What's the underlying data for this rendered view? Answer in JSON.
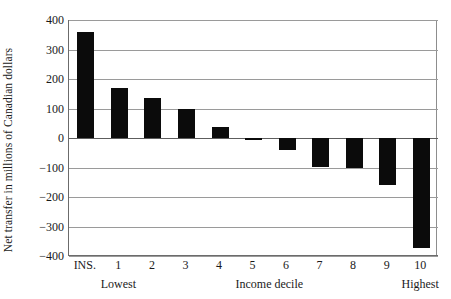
{
  "figure": {
    "title_remnant": "",
    "background": "#ffffff",
    "bar_color": "#0b0b0b",
    "grid_color": "#9a9a9a",
    "axis_color": "#6b6b6b"
  },
  "chart_data": {
    "type": "bar",
    "title": "",
    "xlabel": "Income decile",
    "ylabel": "Net transfer in millions of Canadian dollars",
    "categories": [
      "INS.",
      "1",
      "2",
      "3",
      "4",
      "5",
      "6",
      "7",
      "8",
      "9",
      "10"
    ],
    "values": [
      360,
      171,
      137,
      100,
      38,
      -8,
      -42,
      -97,
      -100,
      -160,
      -373
    ],
    "ylim": [
      -400,
      400
    ],
    "yticks": [
      400,
      300,
      200,
      100,
      0,
      -100,
      -200,
      -300,
      -400
    ],
    "ytick_labels": [
      "400",
      "300",
      "200",
      "100",
      "0",
      "−100",
      "−200",
      "−300",
      "−400"
    ],
    "grid": true,
    "grid_axis": "y",
    "legend": false,
    "legend_position": "none",
    "x_sublabels": [
      {
        "text": "Lowest",
        "at_category": "1"
      },
      {
        "text": "Income decile",
        "at_category": "5.5"
      },
      {
        "text": "Highest",
        "at_category": "10"
      }
    ]
  }
}
